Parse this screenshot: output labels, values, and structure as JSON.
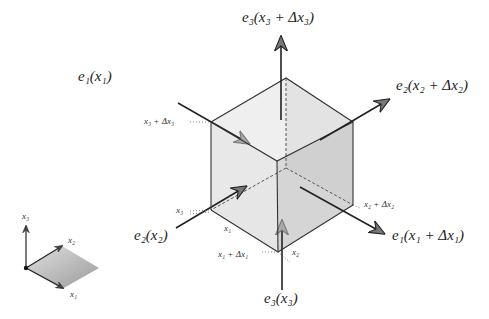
{
  "diagram": {
    "title": "",
    "labels": {
      "e3_top": "e₃(x₃ + Δx₃)",
      "e1_left": "e₁(x₁)",
      "e2_right": "e₂(x₂ + Δx₂)",
      "e2_left": "e₂(x₂)",
      "e1_right": "e₁(x₁ + Δx₁)",
      "e3_bottom": "e₃(x₃)",
      "x3_plus": "x₃ + Δx₃",
      "x3": "x₃",
      "x1": "x₁",
      "x1_plus": "x₁ + Δx₁",
      "x2": "x₂",
      "x2_plus": "x₂ + Δx₂"
    },
    "axes_legend": {
      "x1": "x₁",
      "x2": "x₂",
      "x3": "x₃"
    },
    "colors": {
      "face_light": "#ebebeb",
      "face_mid": "#dcdcdc",
      "face_dark": "#c4c4c4",
      "edge": "#333333",
      "arrow": "#222222",
      "arrow_gray": "#888888"
    }
  }
}
